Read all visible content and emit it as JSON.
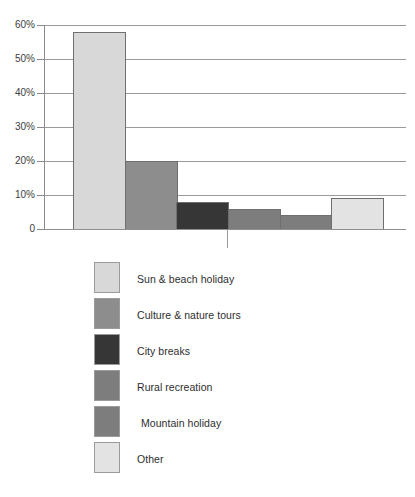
{
  "top_caption": "",
  "chart_data": {
    "type": "bar",
    "title": "",
    "subtitle": "",
    "xlabel": "",
    "ylabel": "",
    "ylim": [
      0,
      60
    ],
    "grid": true,
    "legend_position": "bottom",
    "ytick_labels": [
      "60%",
      "50%",
      "40%",
      "30%",
      "20%",
      "10%",
      "0"
    ],
    "ytick_values": [
      60,
      50,
      40,
      30,
      20,
      10,
      0
    ],
    "categories": [
      "Sun & beach holiday",
      "Culture & nature tours",
      "City breaks",
      "Rural recreation",
      "Mountain holiday",
      "Other"
    ],
    "values": [
      58,
      20,
      8,
      6,
      4,
      9
    ],
    "colors": [
      "#d8d8d8",
      "#8d8d8d",
      "#363636",
      "#7d7d7d",
      "#7d7d7d",
      "#e3e3e3"
    ]
  },
  "legend": {
    "items": [
      {
        "label": "Sun & beach holiday",
        "color": "#d8d8d8"
      },
      {
        "label": "Culture & nature tours",
        "color": "#8d8d8d"
      },
      {
        "label": "City breaks",
        "color": "#363636"
      },
      {
        "label": "Rural recreation",
        "color": "#7d7d7d"
      },
      {
        "label": "Mountain holiday",
        "color": "#7d7d7d"
      },
      {
        "label": "Other",
        "color": "#e3e3e3"
      }
    ]
  }
}
